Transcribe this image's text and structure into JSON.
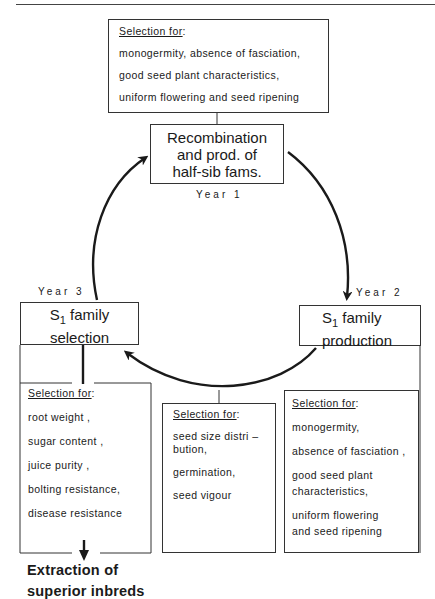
{
  "diagram": {
    "top_selection": {
      "heading": "Selection for",
      "items": [
        "monogermity, absence of fasciation,",
        "good seed plant characteristics,",
        "uniform flowering and seed ripening"
      ]
    },
    "stages": {
      "year1": {
        "year_label": "Year 1",
        "lines": [
          "Recombination",
          "and prod. of",
          "half-sib fams."
        ]
      },
      "year2": {
        "year_label": "Year 2",
        "prefix": "S",
        "subscript": "1",
        "line1_rest": " family",
        "line2": "production"
      },
      "year3": {
        "year_label": "Year 3",
        "prefix": "S",
        "subscript": "1",
        "line1_rest": " family",
        "line2": "selection"
      }
    },
    "left_selection": {
      "heading": "Selection for",
      "items": [
        "root weight ,",
        "sugar content ,",
        "juice purity ,",
        "bolting resistance,",
        "disease resistance"
      ]
    },
    "middle_selection": {
      "heading": "Selection for",
      "items": [
        "seed size distri –",
        "bution,",
        "germination,",
        "seed vigour"
      ]
    },
    "right_selection": {
      "heading": "Selection for",
      "items": [
        "monogermity,",
        "absence of fasciation ,",
        "good seed plant",
        "characteristics,",
        "uniform flowering",
        "and seed ripening"
      ]
    },
    "outcome": {
      "lines": [
        "Extraction of",
        "superior inbreds"
      ]
    },
    "colon": ":"
  }
}
